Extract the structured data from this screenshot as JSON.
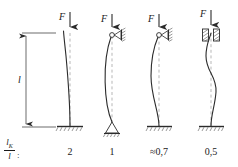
{
  "figure": {
    "ratio_label": {
      "numerator": "l",
      "numerator_sub": "K",
      "denominator": "l",
      "colon": ":"
    },
    "length_label": "l",
    "line_color": "#2b2b2b",
    "dash_color": "#9a9a9a",
    "hatch_color": "#555555",
    "text_color": "#1a1a1a",
    "cases": [
      {
        "id": "case-1",
        "force_label": "F",
        "ratio_value": "2",
        "top_condition": "free",
        "bottom_condition": "fixed"
      },
      {
        "id": "case-2",
        "force_label": "F",
        "ratio_value": "1",
        "top_condition": "pinned-roller-wall",
        "bottom_condition": "pinned"
      },
      {
        "id": "case-3",
        "force_label": "F",
        "ratio_value": "≈0,7",
        "top_condition": "pinned-roller-wall",
        "bottom_condition": "fixed"
      },
      {
        "id": "case-4",
        "force_label": "F",
        "ratio_value": "0,5",
        "top_condition": "guided-fixed",
        "bottom_condition": "fixed"
      }
    ]
  }
}
